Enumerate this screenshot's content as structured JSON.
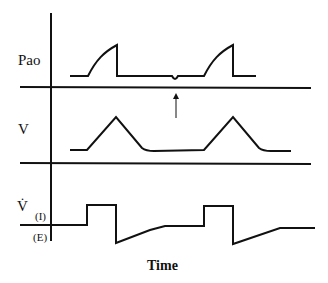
{
  "diagram": {
    "labels": {
      "pressure": "Pao",
      "volume": "V",
      "flow": "V̇",
      "flow_inspiration": "(I)",
      "flow_expiration": "(E)",
      "x_axis": "Time"
    },
    "annotations": {
      "arrow": "upward arrow marking a small negative pressure deflection (patient trigger effort) before the second breath"
    },
    "colors": {
      "line": "#111111",
      "background": "#ffffff"
    }
  }
}
